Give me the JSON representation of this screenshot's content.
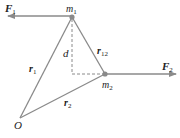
{
  "diagram": {
    "colors": {
      "line": "#8a8a8a",
      "text": "#222222",
      "dot": "#8a8a8a"
    },
    "points": {
      "m1": {
        "label": "m",
        "sub": "1",
        "x": 72,
        "y": 17
      },
      "m2": {
        "label": "m",
        "sub": "2",
        "x": 105,
        "y": 74
      },
      "O": {
        "label": "O",
        "x": 20,
        "y": 118
      }
    },
    "vectors": {
      "F1": {
        "label": "F",
        "sub": "1"
      },
      "F2": {
        "label": "F",
        "sub": "2"
      },
      "r1": {
        "label": "r",
        "sub": "1"
      },
      "r2": {
        "label": "r",
        "sub": "2"
      },
      "r12": {
        "label": "r",
        "sub": "12"
      }
    },
    "distance": {
      "label": "d"
    }
  }
}
